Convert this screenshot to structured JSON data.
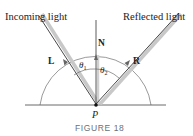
{
  "labels": {
    "incoming": "Incoming light",
    "reflected": "Reflected light",
    "normal": "N",
    "incoming_vector": "L",
    "reflected_vector": "R",
    "theta1": "θ",
    "theta1_sub": "1",
    "theta2": "θ",
    "theta2_sub": "2",
    "point": "P"
  },
  "caption": "FIGURE 18",
  "colors": {
    "line": "#333333",
    "shadow": "#bdbdbd",
    "arc": "#555555",
    "caption": "#6a6f7a"
  }
}
